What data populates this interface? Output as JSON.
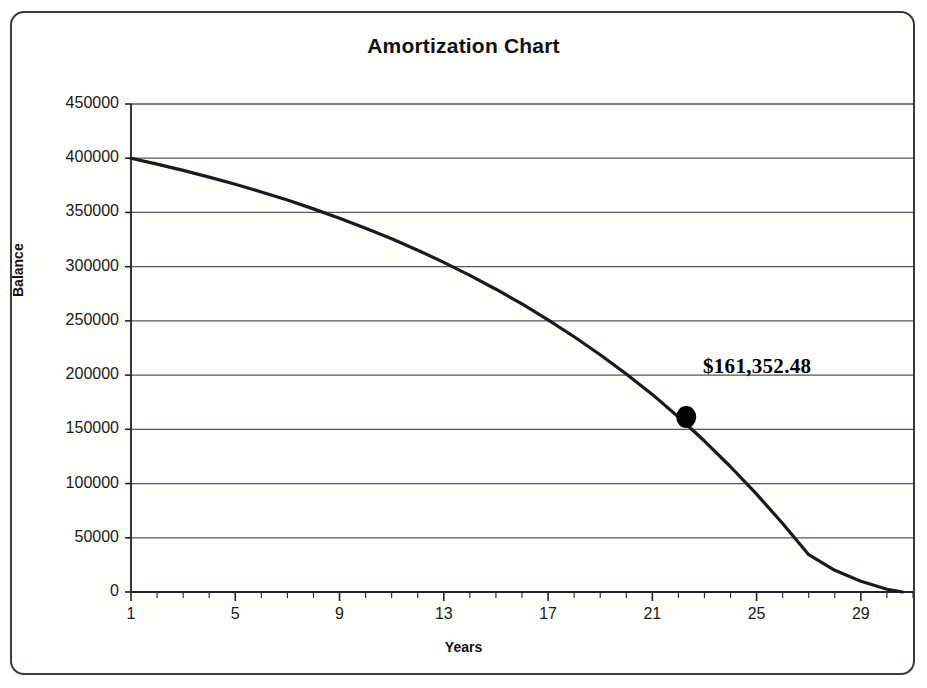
{
  "chart_data": {
    "type": "line",
    "title": "Amortization Chart",
    "xlabel": "Years",
    "ylabel": "Balance",
    "xlim": [
      1,
      31
    ],
    "ylim": [
      0,
      450000
    ],
    "grid": true,
    "legend": false,
    "x_ticks": [
      1,
      5,
      9,
      13,
      17,
      21,
      25,
      29
    ],
    "x_tick_labels": [
      "1",
      "5",
      "9",
      "13",
      "17",
      "21",
      "25",
      "29"
    ],
    "x_minor_tick_interval": 1,
    "y_ticks": [
      0,
      50000,
      100000,
      150000,
      200000,
      250000,
      300000,
      350000,
      400000,
      450000
    ],
    "y_tick_labels": [
      "0",
      "50000",
      "100000",
      "150000",
      "200000",
      "250000",
      "300000",
      "350000",
      "400000",
      "450000"
    ],
    "series": [
      {
        "name": "Balance",
        "color": "#1a1a1a",
        "x": [
          1,
          2,
          3,
          4,
          5,
          6,
          7,
          8,
          9,
          10,
          11,
          12,
          13,
          14,
          15,
          16,
          17,
          18,
          19,
          20,
          21,
          22,
          23,
          24,
          25,
          26,
          27,
          28,
          29,
          30,
          30.6
        ],
        "values": [
          400000,
          394600,
          388800,
          382600,
          376000,
          368900,
          361400,
          353300,
          344700,
          335500,
          325700,
          315200,
          304000,
          292000,
          279200,
          265600,
          251000,
          235400,
          218800,
          201100,
          182200,
          161352,
          139200,
          115500,
          90200,
          63200,
          34400,
          20000,
          10000,
          2500,
          0
        ]
      }
    ],
    "annotations": [
      {
        "label": "$161,352.48",
        "x": 22.3,
        "y": 161352.48,
        "marker": "filled-circle",
        "marker_color": "#000000"
      }
    ]
  },
  "colors": {
    "background": "#fdfdfb",
    "border": "#3a3a3a",
    "gridline": "#555555",
    "axis": "#222222",
    "line": "#1a1a1a",
    "text": "#111111"
  }
}
